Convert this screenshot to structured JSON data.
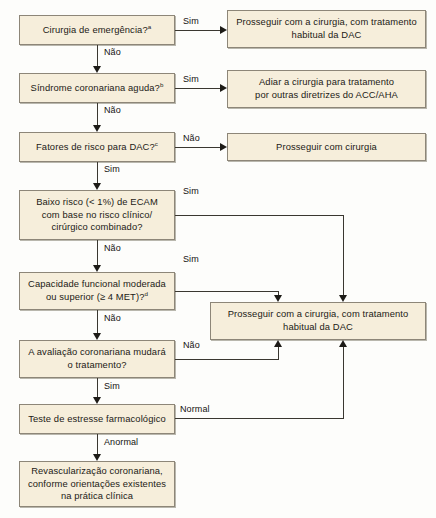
{
  "diagram": {
    "box_fill": "#f6eedb",
    "box_border": "#8d8678",
    "line_color": "#3a3730",
    "nodes": {
      "emergency_surgery": {
        "line1": "Cirurgia de emergência?",
        "sup": "a"
      },
      "acute_coronary_syndrome": {
        "line1": "Síndrome coronariana aguda?",
        "sup": "b"
      },
      "dac_risk_factors": {
        "line1": "Fatores de risco para DAC?",
        "sup": "c"
      },
      "low_risk_ecam": {
        "line1": "Baixo risco (< 1%) de ECAM",
        "line2": "com base no risco clínico/",
        "line3": "cirúrgico combinado?"
      },
      "functional_capacity": {
        "line1": "Capacidade funcional moderada",
        "line2": "ou superior (≥ 4 MET)?",
        "sup": "d"
      },
      "coronary_eval_changes": {
        "line1": "A avaliação coronariana mudará",
        "line2": "o tratamento?"
      },
      "pharmacologic_stress_test": {
        "line1": "Teste de estresse farmacológico"
      },
      "coronary_revascularization": {
        "line1": "Revascularização coronariana,",
        "line2": "conforme orientações existentes",
        "line3": "na prática clínica"
      },
      "proceed_surgery_dac_top": {
        "line1": "Prosseguir com a cirurgia, com tratamento",
        "line2": "habitual da DAC"
      },
      "defer_surgery_acc_aha": {
        "line1": "Adiar a cirurgia para tratamento",
        "line2": "por outras diretrizes do ACC/AHA"
      },
      "proceed_surgery": {
        "line1": "Prosseguir com cirurgia"
      },
      "proceed_surgery_dac_mid": {
        "line1": "Prosseguir com a cirurgia, com tratamento",
        "line2": "habitual da DAC"
      }
    },
    "edge_labels": {
      "emergency_yes": "Sim",
      "emergency_no": "Não",
      "acs_yes": "Sim",
      "acs_no": "Não",
      "riskfactors_no": "Não",
      "riskfactors_yes": "Sim",
      "lowrisk_yes": "Sim",
      "lowrisk_no": "Não",
      "functional_yes": "Sim",
      "functional_no": "Não",
      "evalchange_no": "Não",
      "evalchange_yes": "Sim",
      "stress_normal": "Normal",
      "stress_abnormal": "Anormal"
    }
  }
}
